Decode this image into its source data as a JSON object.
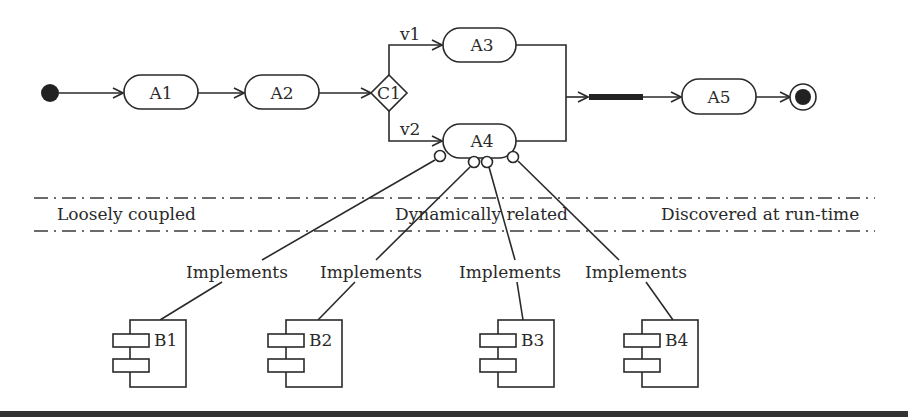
{
  "diagram": {
    "type": "activity-component-diagram",
    "start": {
      "label": ""
    },
    "activities": [
      {
        "id": "A1",
        "label": "A1"
      },
      {
        "id": "A2",
        "label": "A2"
      },
      {
        "id": "A3",
        "label": "A3"
      },
      {
        "id": "A4",
        "label": "A4"
      },
      {
        "id": "A5",
        "label": "A5"
      }
    ],
    "decision": {
      "id": "C1",
      "label": "C1"
    },
    "branches": [
      {
        "label": "v1",
        "target": "A3"
      },
      {
        "label": "v2",
        "target": "A4"
      }
    ],
    "join": {
      "label": ""
    },
    "end": {
      "label": ""
    },
    "zones": {
      "left": "Loosely coupled",
      "center": "Dynamically related",
      "right": "Discovered at run-time"
    },
    "relations": [
      {
        "label": "Implements",
        "from": "B1",
        "to": "A4"
      },
      {
        "label": "Implements",
        "from": "B2",
        "to": "A4"
      },
      {
        "label": "Implements",
        "from": "B3",
        "to": "A4"
      },
      {
        "label": "Implements",
        "from": "B4",
        "to": "A4"
      }
    ],
    "components": [
      {
        "id": "B1",
        "label": "B1"
      },
      {
        "id": "B2",
        "label": "B2"
      },
      {
        "id": "B3",
        "label": "B3"
      },
      {
        "id": "B4",
        "label": "B4"
      }
    ]
  }
}
